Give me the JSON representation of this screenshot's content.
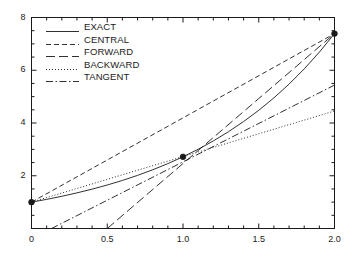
{
  "chart_data": {
    "type": "line",
    "title": "",
    "xlabel": "",
    "ylabel": "",
    "xlim": [
      0,
      2
    ],
    "ylim": [
      0,
      8
    ],
    "grid": false,
    "legend_position": "upper-left",
    "xticks": [
      "0",
      "0.5",
      "1.0",
      "1.5",
      "2.0"
    ],
    "xtick_values": [
      0,
      0.5,
      1.0,
      1.5,
      2.0
    ],
    "xminor_step": 0.1,
    "yticks": [
      "2",
      "4",
      "6",
      "8"
    ],
    "ytick_values": [
      2,
      4,
      6,
      8
    ],
    "yminor_step": 0.5,
    "markers": [
      {
        "x": 0.0,
        "y": 1.0
      },
      {
        "x": 1.0,
        "y": 2.718
      },
      {
        "x": 2.0,
        "y": 7.389
      }
    ],
    "series": [
      {
        "name": "EXACT",
        "style": "solid",
        "points": [
          [
            0.0,
            1.0
          ],
          [
            0.1,
            1.105
          ],
          [
            0.2,
            1.221
          ],
          [
            0.3,
            1.35
          ],
          [
            0.4,
            1.492
          ],
          [
            0.5,
            1.649
          ],
          [
            0.6,
            1.822
          ],
          [
            0.7,
            2.014
          ],
          [
            0.8,
            2.226
          ],
          [
            0.9,
            2.46
          ],
          [
            1.0,
            2.718
          ],
          [
            1.1,
            3.004
          ],
          [
            1.2,
            3.32
          ],
          [
            1.3,
            3.669
          ],
          [
            1.4,
            4.055
          ],
          [
            1.5,
            4.482
          ],
          [
            1.6,
            4.953
          ],
          [
            1.7,
            5.474
          ],
          [
            1.8,
            6.05
          ],
          [
            1.9,
            6.686
          ],
          [
            2.0,
            7.389
          ]
        ]
      },
      {
        "name": "CENTRAL",
        "style": "dashed",
        "points": [
          [
            0.0,
            1.0
          ],
          [
            2.0,
            7.389
          ]
        ]
      },
      {
        "name": "FORWARD",
        "style": "longdash",
        "points": [
          [
            0.5,
            0.0
          ],
          [
            2.0,
            7.389
          ]
        ]
      },
      {
        "name": "BACKWARD",
        "style": "dotted",
        "points": [
          [
            0.0,
            1.0
          ],
          [
            2.0,
            4.455
          ]
        ]
      },
      {
        "name": "TANGENT",
        "style": "dashdot",
        "points": [
          [
            0.132,
            0.0
          ],
          [
            2.0,
            5.437
          ]
        ]
      }
    ]
  },
  "legend": {
    "entries": [
      {
        "label": "EXACT"
      },
      {
        "label": "CENTRAL"
      },
      {
        "label": "FORWARD"
      },
      {
        "label": "BACKWARD"
      },
      {
        "label": "TANGENT"
      }
    ]
  },
  "colors": {
    "line": "#1a1a1a",
    "axis": "#1a1a1a",
    "background": "#ffffff"
  }
}
